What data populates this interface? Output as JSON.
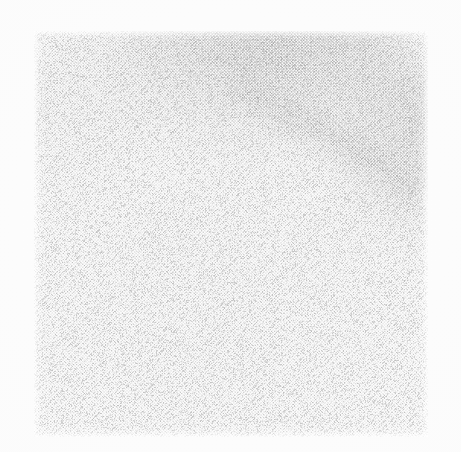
{
  "canvas": {
    "width": 461,
    "height": 452,
    "paper_color": "#fdfdfd",
    "label": "scanned halftone photographic plate"
  },
  "plate": {
    "name": "halftone-scan-plate",
    "left": 34,
    "top": 31,
    "width": 394,
    "height": 406,
    "base_color": "#ffffff",
    "description": "square scanned photographic image reproduced as a coarse halftone dot screen"
  },
  "screen": {
    "type": "halftone-dot-screen",
    "pitch_px": 3.05,
    "angle_deg": 45,
    "dot_color": "#787878",
    "paper_color": "#ffffff",
    "note": "two interleaved 45-degree dot grids producing a woven diamond moire"
  },
  "tone_regions": [
    {
      "name": "tone-shadow-top",
      "label": "dark diffuse mass along the top edge",
      "center_x_pct": 60,
      "center_y_pct": -6,
      "radius_x_pct": 62,
      "radius_y_pct": 46,
      "peak_opacity": 0.82,
      "color": "#282828"
    },
    {
      "name": "tone-shadow-right",
      "label": "secondary shadow lobe down the right edge",
      "center_x_pct": 99,
      "center_y_pct": 22,
      "radius_x_pct": 34,
      "radius_y_pct": 40,
      "peak_opacity": 0.55,
      "color": "#373737"
    },
    {
      "name": "tone-haze-left",
      "label": "faint haze in the upper-left",
      "center_x_pct": 6,
      "center_y_pct": 16,
      "radius_x_pct": 40,
      "radius_y_pct": 30,
      "peak_opacity": 0.22,
      "color": "#828282"
    },
    {
      "name": "tone-body",
      "label": "overall emulsion density across the middle and lower field",
      "center_x_pct": 46,
      "center_y_pct": 62,
      "radius_x_pct": 78,
      "radius_y_pct": 70,
      "peak_opacity": 0.16,
      "color": "#a0a0a0"
    },
    {
      "name": "tone-corner-lift",
      "label": "pale lift at the extreme top-right corner",
      "center_x_pct": 99,
      "center_y_pct": 1,
      "radius_x_pct": 16,
      "radius_y_pct": 16,
      "peak_opacity": 0.72,
      "color": "#ffffff"
    }
  ],
  "streak_smudge": {
    "name": "diagonal-smudge",
    "label": "soft dark smear surrounding the sharp diagonal lines",
    "left": 200,
    "top": 22,
    "width": 215,
    "height": 56,
    "rotate_deg": 30,
    "color": "#464646",
    "peak_opacity": 0.34
  },
  "streaks": [
    {
      "name": "streak-primary",
      "label": "longest sharp dark diagonal line",
      "x": 216,
      "y": 55,
      "length": 196,
      "thickness": 1.25,
      "rotate_deg": 32.5,
      "color": "#3a3a3a",
      "opacity": 0.8,
      "blur": 0.35
    },
    {
      "name": "streak-secondary",
      "label": "second sharp diagonal line just below the primary",
      "x": 232,
      "y": 52,
      "length": 182,
      "thickness": 1.1,
      "rotate_deg": 36.5,
      "color": "#434343",
      "opacity": 0.72,
      "blur": 0.4
    },
    {
      "name": "streak-third",
      "label": "third finer diagonal line converging with the others",
      "x": 252,
      "y": 48,
      "length": 168,
      "thickness": 0.95,
      "rotate_deg": 41.0,
      "color": "#4e4e4e",
      "opacity": 0.62,
      "blur": 0.45
    },
    {
      "name": "streak-upper-faint",
      "label": "faint shallow line above the main bundle",
      "x": 200,
      "y": 68,
      "length": 176,
      "thickness": 0.9,
      "rotate_deg": 24.0,
      "color": "#5c5c5c",
      "opacity": 0.42,
      "blur": 0.7
    },
    {
      "name": "streak-upper-shallow",
      "label": "very shallow faint line running toward the right edge",
      "x": 212,
      "y": 78,
      "length": 190,
      "thickness": 0.8,
      "rotate_deg": 17.0,
      "color": "#6a6a6a",
      "opacity": 0.32,
      "blur": 0.9
    },
    {
      "name": "streak-lower-tail",
      "label": "short tail continuing past the convergence point",
      "x": 352,
      "y": 148,
      "length": 62,
      "thickness": 1.0,
      "rotate_deg": 39.0,
      "color": "#4a4a4a",
      "opacity": 0.55,
      "blur": 0.5
    },
    {
      "name": "streak-hairline-a",
      "label": "hairline running parallel inside the smudge",
      "x": 246,
      "y": 64,
      "length": 150,
      "thickness": 0.7,
      "rotate_deg": 34.0,
      "color": "#555555",
      "opacity": 0.45,
      "blur": 0.6
    },
    {
      "name": "streak-hairline-b",
      "label": "short hairline near the top of the bundle",
      "x": 258,
      "y": 40,
      "length": 96,
      "thickness": 0.7,
      "rotate_deg": 28.0,
      "color": "#5f5f5f",
      "opacity": 0.38,
      "blur": 0.7
    }
  ],
  "grain": {
    "name": "scan-grain",
    "seed": 20240517,
    "density": 0.34,
    "dot_color": "#8c8c8c",
    "opacity": 0.5
  }
}
